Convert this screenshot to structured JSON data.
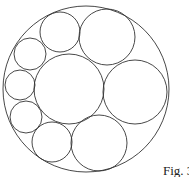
{
  "figure": {
    "caption": "Fig. 3",
    "stroke_color": "#333333",
    "background": "#ffffff",
    "outer_circle": {
      "cx": 86,
      "cy": 89,
      "r": 83
    },
    "inner_circles": [
      {
        "name": "center-large",
        "cx": 69,
        "cy": 89,
        "r": 35
      },
      {
        "name": "right-large",
        "cx": 135,
        "cy": 92,
        "r": 32
      },
      {
        "name": "top-right",
        "cx": 107,
        "cy": 37,
        "r": 28
      },
      {
        "name": "top-middle",
        "cx": 60,
        "cy": 32,
        "r": 20
      },
      {
        "name": "upper-left",
        "cx": 30,
        "cy": 54,
        "r": 16
      },
      {
        "name": "left",
        "cx": 20,
        "cy": 85,
        "r": 15
      },
      {
        "name": "lower-left",
        "cx": 26,
        "cy": 117,
        "r": 16
      },
      {
        "name": "bottom-middle",
        "cx": 52,
        "cy": 142,
        "r": 20
      },
      {
        "name": "bottom-right",
        "cx": 99,
        "cy": 143,
        "r": 28
      }
    ]
  }
}
